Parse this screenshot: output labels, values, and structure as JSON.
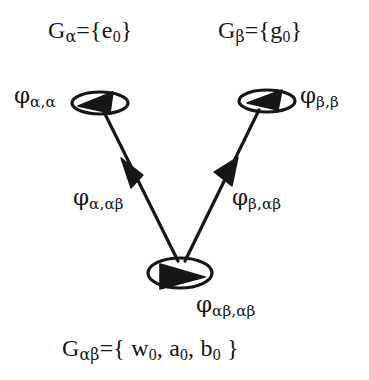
{
  "figure": {
    "kind": "commutative-diagram",
    "background_color": "#ffffff",
    "stroke_color": "#161616"
  },
  "nodes": [
    {
      "id": "alpha",
      "set_label": "G",
      "set_subscript": "α",
      "set_equals": "={e",
      "set_sub_index": "0",
      "set_close": "}",
      "loop_label_phi": "φ",
      "loop_label_sub": "α,α"
    },
    {
      "id": "beta",
      "set_label": "G",
      "set_subscript": "β",
      "set_equals": "={g",
      "set_sub_index": "0",
      "set_close": "}",
      "loop_label_phi": "φ",
      "loop_label_sub": "β,β"
    },
    {
      "id": "alphabeta",
      "set_label": "G",
      "set_subscript": "αβ",
      "set_equals": "={ w",
      "set_sub_index": "0",
      "set_mid_1": ", a",
      "set_sub_index_2": "0",
      "set_mid_2": ", b",
      "set_sub_index_3": "0",
      "set_close": " }",
      "loop_label_phi": "φ",
      "loop_label_sub": "αβ,αβ"
    }
  ],
  "edges": [
    {
      "id": "alpha-to-alphabeta",
      "from": "alpha",
      "to": "alphabeta",
      "label_phi": "φ",
      "label_sub": "α,αβ",
      "arrow": "solid-triangle-midpoint"
    },
    {
      "id": "beta-to-alphabeta",
      "from": "beta",
      "to": "alphabeta",
      "label_phi": "φ",
      "label_sub": "β,αβ",
      "arrow": "solid-triangle-midpoint"
    }
  ],
  "labels": {
    "set_alpha": {
      "base": "G",
      "sub": "α",
      "rest": "={e",
      "sub2": "0",
      "tail": "}"
    },
    "set_beta": {
      "base": "G",
      "sub": "β",
      "rest": "={g",
      "sub2": "0",
      "tail": "}"
    },
    "set_alphabeta": {
      "base": "G",
      "sub": "αβ",
      "rest": "={ w",
      "sub2": "0",
      "mid1": ", a",
      "sub3": "0",
      "mid2": ", b",
      "sub4": "0",
      "tail": " }"
    },
    "phi_alpha_alpha": {
      "base": "φ",
      "sub": "α,α"
    },
    "phi_beta_beta": {
      "base": "φ",
      "sub": "β,β"
    },
    "phi_alpha_alphabeta": {
      "base": "φ",
      "sub": "α,αβ"
    },
    "phi_beta_alphabeta": {
      "base": "φ",
      "sub": "β,αβ"
    },
    "phi_alphabeta_alphabeta": {
      "base": "φ",
      "sub": "αβ,αβ"
    }
  }
}
